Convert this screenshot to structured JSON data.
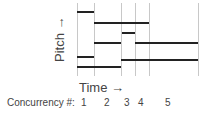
{
  "labels": {
    "y_axis": "Pitch →",
    "x_axis": "Time →",
    "concurrency_prefix": "Concurrency #:"
  },
  "time_boundaries_px": [
    77,
    94,
    121,
    135,
    149,
    198
  ],
  "concurrency_numbers": [
    {
      "label": "1",
      "x": 81
    },
    {
      "label": "2",
      "x": 104
    },
    {
      "label": "3",
      "x": 124
    },
    {
      "label": "4",
      "x": 138
    },
    {
      "label": "5",
      "x": 165
    }
  ],
  "notes": [
    {
      "x1": 77,
      "x2": 94,
      "y": 11
    },
    {
      "x1": 94,
      "x2": 149,
      "y": 22
    },
    {
      "x1": 122,
      "x2": 135,
      "y": 32
    },
    {
      "x1": 94,
      "x2": 121,
      "y": 42
    },
    {
      "x1": 135,
      "x2": 198,
      "y": 42
    },
    {
      "x1": 77,
      "x2": 94,
      "y": 56
    },
    {
      "x1": 121,
      "x2": 198,
      "y": 59
    },
    {
      "x1": 77,
      "x2": 121,
      "y": 66
    }
  ]
}
